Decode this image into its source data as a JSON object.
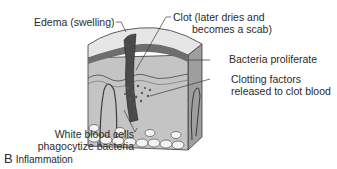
{
  "figure": {
    "panel_letter": "B",
    "caption": "Inflammation",
    "labels": {
      "edema": "Edema (swelling)",
      "clot_line1": "Clot (later dries and",
      "clot_line2": "becomes a scab)",
      "bacteria": "Bacteria proliferate",
      "clotting_line1": "Clotting factors",
      "clotting_line2": "released to clot blood",
      "wbc_line1": "White blood cells",
      "wbc_line2": "phagocytize bacteria"
    }
  },
  "colors": {
    "text": "#2b2b2b",
    "tissue_light": "#d9d9d9",
    "tissue_mid": "#bdbdbd",
    "tissue_dark": "#8f8f8f",
    "outline": "#3a3a3a",
    "fat_cells": "#f4f4f4"
  }
}
